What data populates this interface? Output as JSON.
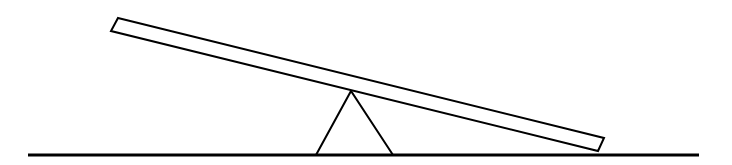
{
  "diagram": {
    "title": "",
    "stroke_color": "#000000",
    "fill_color": "#ffffff",
    "ground": {
      "x1": 28,
      "y1": 155,
      "x2": 699,
      "y2": 155,
      "stroke_width": 3
    },
    "plank": {
      "points": "118,18 604,138 598,151 111,31",
      "stroke_width": 2
    },
    "fulcrum": {
      "points": "316,155 351,91 393,155",
      "stroke_width": 2
    }
  }
}
